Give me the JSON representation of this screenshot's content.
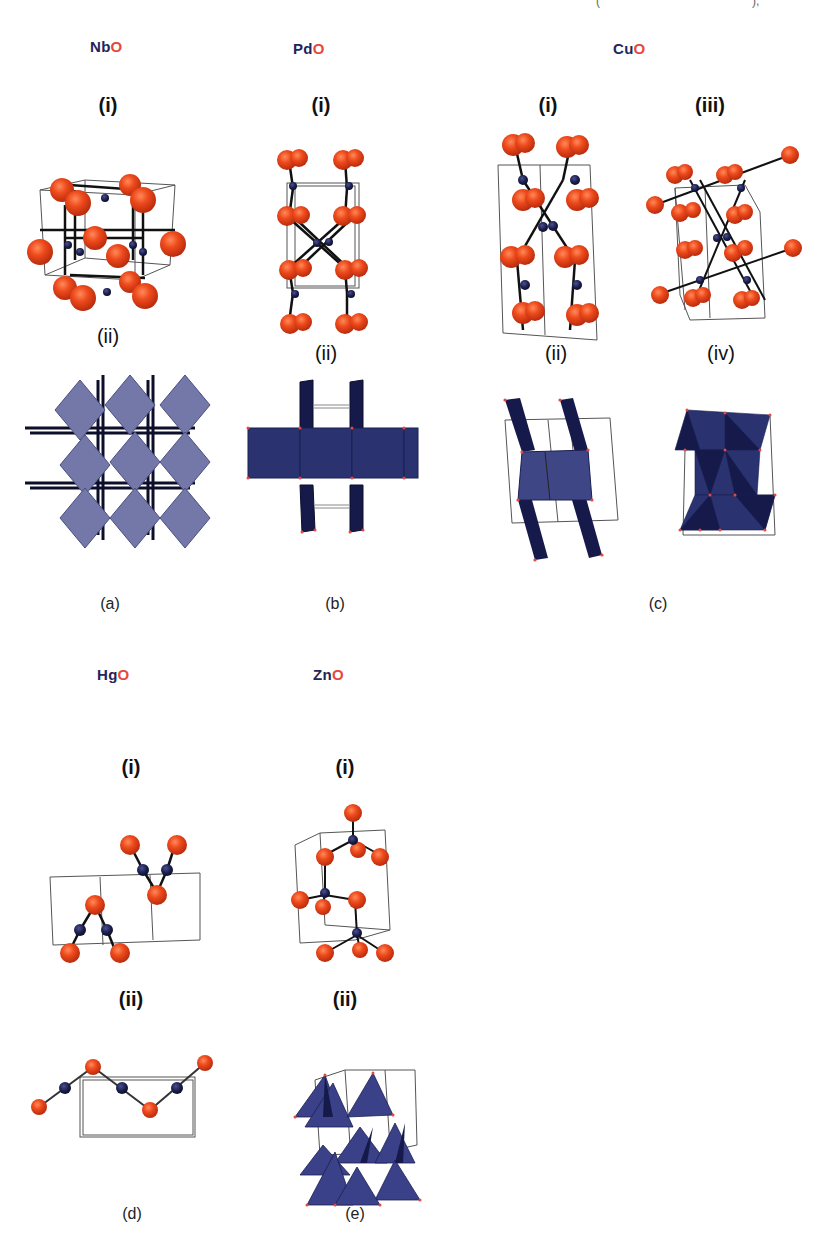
{
  "figure": {
    "top_fragment": "(",
    "top_fragment_right": "),",
    "colors": {
      "metal_label": "#22245a",
      "oxygen_label": "#e8473c",
      "oxygen_atom": "#e8401c",
      "metal_atom": "#1c1f4e",
      "polyhedron_light": "#7478a8",
      "polyhedron_dark": "#2a3270",
      "polyhedron_navy": "#161a4a",
      "cell_edge": "#555555"
    },
    "panels": [
      {
        "id": "a",
        "label": "(a)",
        "compound": {
          "metal": "Nb",
          "oxygen": "O"
        },
        "views": [
          {
            "tag": "(i)",
            "type": "ball-and-stick"
          },
          {
            "tag": "(ii)",
            "type": "polyhedral"
          }
        ]
      },
      {
        "id": "b",
        "label": "(b)",
        "compound": {
          "metal": "Pd",
          "oxygen": "O"
        },
        "views": [
          {
            "tag": "(i)",
            "type": "ball-and-stick"
          },
          {
            "tag": "(ii)",
            "type": "polyhedral"
          }
        ]
      },
      {
        "id": "c",
        "label": "(c)",
        "compound": {
          "metal": "Cu",
          "oxygen": "O"
        },
        "views": [
          {
            "tag": "(i)",
            "type": "ball-and-stick"
          },
          {
            "tag": "(iii)",
            "type": "ball-and-stick"
          },
          {
            "tag": "(ii)",
            "type": "polyhedral"
          },
          {
            "tag": "(iv)",
            "type": "polyhedral"
          }
        ]
      },
      {
        "id": "d",
        "label": "(d)",
        "compound": {
          "metal": "Hg",
          "oxygen": "O"
        },
        "views": [
          {
            "tag": "(i)",
            "type": "ball-and-stick"
          },
          {
            "tag": "(ii)",
            "type": "chain"
          }
        ]
      },
      {
        "id": "e",
        "label": "(e)",
        "compound": {
          "metal": "Zn",
          "oxygen": "O"
        },
        "views": [
          {
            "tag": "(i)",
            "type": "ball-and-stick"
          },
          {
            "tag": "(ii)",
            "type": "polyhedral"
          }
        ]
      }
    ]
  }
}
